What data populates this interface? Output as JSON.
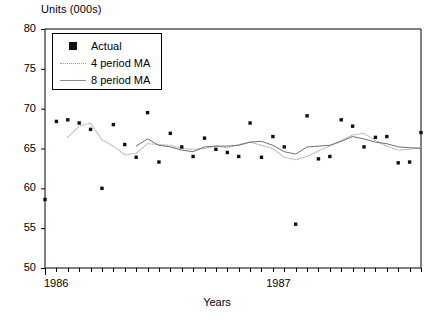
{
  "chart_data": {
    "type": "scatter",
    "title": "",
    "ylabel": "Units (000s)",
    "xlabel": "Years",
    "ylim": [
      50,
      80
    ],
    "yticks": [
      50,
      55,
      60,
      65,
      70,
      75,
      80
    ],
    "xlim": [
      0,
      33
    ],
    "xtick_labels": [
      "1986",
      "1987"
    ],
    "xtick_positions": [
      0,
      19.5
    ],
    "x_minor_ticks": 33,
    "grid": false,
    "legend_position": "top-left",
    "series": [
      {
        "name": "Actual",
        "style": "markers",
        "marker": "filled-square",
        "color": "#111111",
        "x": [
          0,
          1,
          2,
          3,
          4,
          5,
          6,
          7,
          8,
          9,
          10,
          11,
          12,
          13,
          14,
          15,
          16,
          17,
          18,
          19,
          20,
          21,
          22,
          23,
          24,
          25,
          26,
          27,
          28,
          29,
          30,
          31,
          32,
          33
        ],
        "values": [
          58.6,
          68.4,
          68.6,
          68.2,
          67.4,
          60.0,
          68.0,
          65.5,
          63.9,
          69.5,
          63.3,
          66.9,
          65.2,
          64.0,
          66.3,
          64.9,
          64.5,
          64.0,
          68.2,
          63.9,
          66.5,
          65.2,
          55.5,
          69.1,
          63.7,
          64.0,
          68.6,
          67.8,
          65.2,
          66.4,
          66.5,
          63.2,
          63.3,
          67.0
        ]
      },
      {
        "name": "4 period MA",
        "style": "dotted-line",
        "color": "#b5b5b5",
        "x": [
          2,
          3,
          4,
          5,
          6,
          7,
          8,
          9,
          10,
          11,
          12,
          13,
          14,
          15,
          16,
          17,
          18,
          19,
          20,
          21,
          22,
          23,
          24,
          25,
          26,
          27,
          28,
          29,
          30,
          31,
          32,
          33
        ],
        "values": [
          66.4,
          67.8,
          68.2,
          66.1,
          65.3,
          64.2,
          64.4,
          65.6,
          65.5,
          65.4,
          65.0,
          64.9,
          65.0,
          65.3,
          65.1,
          65.5,
          65.8,
          65.4,
          65.0,
          63.9,
          63.6,
          64.0,
          64.7,
          65.3,
          66.0,
          66.7,
          66.9,
          66.0,
          65.3,
          64.8,
          64.9,
          65.2
        ]
      },
      {
        "name": "8 period MA",
        "style": "solid-line",
        "color": "#6f6f6f",
        "x": [
          8,
          9,
          10,
          11,
          12,
          13,
          14,
          15,
          16,
          17,
          18,
          19,
          20,
          21,
          22,
          23,
          24,
          25,
          26,
          27,
          28,
          29,
          30,
          31,
          32,
          33
        ],
        "values": [
          65.3,
          66.2,
          65.4,
          65.2,
          64.8,
          64.6,
          65.2,
          65.3,
          65.3,
          65.4,
          65.8,
          65.9,
          65.4,
          64.6,
          64.3,
          65.2,
          65.3,
          65.4,
          65.9,
          66.5,
          66.2,
          65.8,
          65.6,
          65.2,
          65.1,
          65.0
        ]
      }
    ]
  },
  "legend": {
    "items": [
      {
        "label": "Actual",
        "key": "filled-square-marker"
      },
      {
        "label": "4 period MA",
        "key": "dotted-line-key"
      },
      {
        "label": "8 period MA",
        "key": "solid-line-key"
      }
    ]
  },
  "axes": {
    "y_title": "Units (000s)",
    "x_title": "Years",
    "y_tick_labels": [
      "80",
      "75",
      "70",
      "65",
      "60",
      "55",
      "50"
    ],
    "x_tick_labels": [
      "1986",
      "1987"
    ]
  },
  "colors": {
    "axis": "#000000",
    "marker": "#111111",
    "ma4": "#b5b5b5",
    "ma8": "#6f6f6f",
    "background": "#ffffff"
  }
}
